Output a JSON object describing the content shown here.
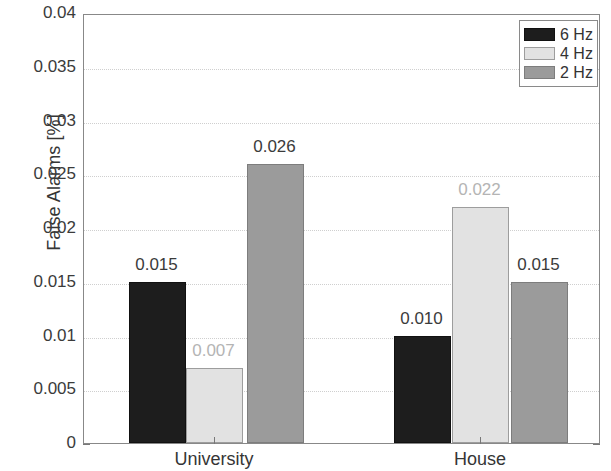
{
  "chart_data": {
    "type": "bar",
    "title": "",
    "subtitle": "",
    "xlabel": "",
    "ylabel": "False Alarms [%]",
    "categories": [
      "University",
      "House"
    ],
    "series": [
      {
        "name": "6 Hz",
        "values": [
          0.015,
          0.01
        ],
        "color": "#1d1d1d"
      },
      {
        "name": "4 Hz",
        "values": [
          0.007,
          0.022
        ],
        "color": "#e2e2e2"
      },
      {
        "name": "2 Hz",
        "values": [
          0.026,
          0.015
        ],
        "color": "#9b9b9b"
      }
    ],
    "data_labels": [
      [
        "0.015",
        "0.010"
      ],
      [
        "0.007",
        "0.022"
      ],
      [
        "0.026",
        "0.015"
      ]
    ],
    "ylim": [
      0,
      0.04
    ],
    "yticks": [
      0,
      0.005,
      0.01,
      0.015,
      0.02,
      0.025,
      0.03,
      0.035,
      0.04
    ],
    "ytick_labels": [
      "0",
      "0.005",
      "0.01",
      "0.015",
      "0.02",
      "0.025",
      "0.03",
      "0.035",
      "0.04"
    ],
    "grid": true,
    "grid_style": "dotted-horizontal",
    "legend_position": "top-right",
    "legend_entries": [
      "6 Hz",
      "4 Hz",
      "2 Hz"
    ],
    "background_color": "#ffffff",
    "axis_color": "#888888"
  }
}
